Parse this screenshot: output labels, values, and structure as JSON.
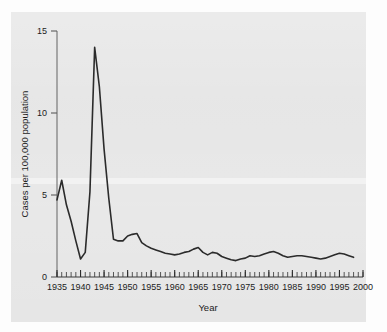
{
  "figure": {
    "background_color": "#e6e6e6",
    "page_color": "#fdfdfd",
    "line_color": "#2b2b2b"
  },
  "chart_data": {
    "type": "line",
    "title": "",
    "xlabel": "Year",
    "ylabel": "Cases per 100,000 population",
    "xlim": [
      1935,
      2000
    ],
    "ylim": [
      0,
      15
    ],
    "y_ticks": [
      0,
      5,
      10,
      15
    ],
    "y_tick_labels": [
      "0",
      "5",
      "10",
      "15"
    ],
    "x_ticks": [
      1935,
      1940,
      1945,
      1950,
      1955,
      1960,
      1965,
      1970,
      1975,
      1980,
      1985,
      1990,
      1995,
      2000
    ],
    "x_tick_labels": [
      "1935",
      "1940",
      "1945",
      "1950",
      "1955",
      "1960",
      "1965",
      "1970",
      "1975",
      "1980",
      "1985",
      "1990",
      "1995",
      "2000"
    ],
    "x_minor_tick_interval": 1,
    "grid": false,
    "legend": null,
    "series": [
      {
        "name": "Cases per 100,000 population",
        "x": [
          1935,
          1936,
          1937,
          1938,
          1939,
          1940,
          1941,
          1942,
          1943,
          1944,
          1945,
          1946,
          1947,
          1948,
          1949,
          1950,
          1951,
          1952,
          1953,
          1954,
          1955,
          1956,
          1957,
          1958,
          1959,
          1960,
          1961,
          1962,
          1963,
          1964,
          1965,
          1966,
          1967,
          1968,
          1969,
          1970,
          1971,
          1972,
          1973,
          1974,
          1975,
          1976,
          1977,
          1978,
          1979,
          1980,
          1981,
          1982,
          1983,
          1984,
          1985,
          1986,
          1987,
          1988,
          1989,
          1990,
          1991,
          1992,
          1993,
          1994,
          1995,
          1996,
          1997,
          1998
        ],
        "y": [
          4.7,
          5.9,
          4.4,
          3.4,
          2.2,
          1.1,
          1.5,
          5.2,
          14.0,
          11.6,
          7.8,
          4.8,
          2.3,
          2.2,
          2.2,
          2.5,
          2.6,
          2.65,
          2.1,
          1.9,
          1.75,
          1.65,
          1.55,
          1.45,
          1.4,
          1.35,
          1.4,
          1.5,
          1.55,
          1.7,
          1.8,
          1.5,
          1.35,
          1.5,
          1.45,
          1.25,
          1.15,
          1.05,
          1.0,
          1.1,
          1.15,
          1.3,
          1.25,
          1.3,
          1.4,
          1.5,
          1.55,
          1.45,
          1.3,
          1.2,
          1.25,
          1.3,
          1.3,
          1.25,
          1.2,
          1.15,
          1.1,
          1.15,
          1.25,
          1.35,
          1.45,
          1.4,
          1.3,
          1.2
        ]
      }
    ]
  }
}
